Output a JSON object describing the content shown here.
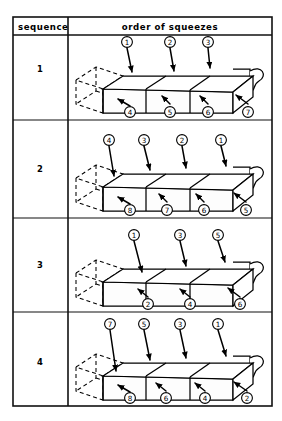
{
  "figure": {
    "columns": [
      {
        "key": "sequence",
        "label": "sequence"
      },
      {
        "key": "order",
        "label": "order of squeezes"
      }
    ],
    "colors": {
      "ink": "#000000",
      "rule": "#111111",
      "paper": "#ffffff",
      "face_fill": "#fdfdfd"
    },
    "legend_note": "",
    "object_described": "three-segment compressible tube shown in isometric projection with dashed uncompressed outline at left end and curled flexible hose at right end",
    "rows": [
      {
        "sequence": "1",
        "segments": 3,
        "top_callouts": [
          "1",
          "2",
          "3"
        ],
        "bottom_callouts": [
          "4",
          "5",
          "6",
          "7"
        ],
        "pattern": "top left-to-right 1-2-3, bottom left-to-right 4-5-6-7"
      },
      {
        "sequence": "2",
        "segments": 3,
        "top_callouts": [
          "4",
          "3",
          "2",
          "1"
        ],
        "bottom_callouts": [
          "8",
          "7",
          "6",
          "5"
        ],
        "pattern": "top right-to-left 1-2-3-4, bottom right-to-left 5-6-7-8"
      },
      {
        "sequence": "3",
        "segments": 3,
        "top_callouts": [
          "1",
          "3",
          "5"
        ],
        "bottom_callouts": [
          "2",
          "4",
          "6"
        ],
        "pattern": "alternating top/bottom left-to-right, odd on top, even on bottom"
      },
      {
        "sequence": "4",
        "segments": 3,
        "top_callouts": [
          "7",
          "5",
          "3",
          "1"
        ],
        "bottom_callouts": [
          "8",
          "6",
          "4",
          "2"
        ],
        "pattern": "alternating top/bottom right-to-left, odd on top, even on bottom"
      }
    ],
    "callout_style": "circled numerals with straight leader lines and arrowheads",
    "geometry": {
      "table_left": 13,
      "table_top": 17,
      "table_right": 272,
      "table_bottom": 406,
      "column_divider_x": 68,
      "header_bottom_y": 35,
      "row_dividers_y": [
        120,
        218,
        312
      ]
    }
  }
}
